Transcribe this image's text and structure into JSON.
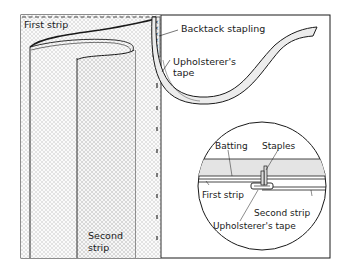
{
  "diagram": {
    "colors": {
      "ink": "#1a1a1a",
      "fabric_hatch": "#b8b8b8",
      "background": "#ffffff",
      "batting": "#e6e6e6",
      "tape_fill": "#ebebeb"
    },
    "labels": {
      "first_strip": "First strip",
      "second_strip_line1": "Second",
      "second_strip_line2": "strip",
      "backtack_stapling": "Backtack stapling",
      "upholsterers_tape_line1": "Upholsterer's",
      "upholsterers_tape_line2": "tape"
    },
    "inset": {
      "batting": "Batting",
      "staples": "Staples",
      "first_strip": "First strip",
      "second_strip": "Second strip",
      "upholsterers_tape": "Upholsterer's tape"
    }
  }
}
